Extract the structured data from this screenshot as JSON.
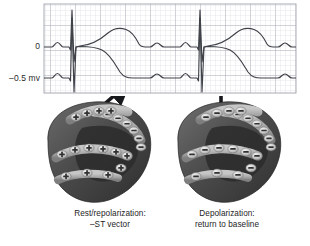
{
  "figure": {
    "kind": "ecg-vector-diagram",
    "background_color": "#ffffff"
  },
  "ecg": {
    "y_axis": {
      "labels": [
        {
          "text": "0",
          "value": 0,
          "unit": "mv"
        },
        {
          "text": "–0.5 mv",
          "value": -0.5,
          "unit": "mv"
        }
      ]
    },
    "grid": {
      "minor_color": "#d8dae0",
      "major_color": "#a9acb5",
      "minor_spacing_px": 5,
      "major_every": 5,
      "left_px": 44,
      "right_px": 296,
      "top_px": 4,
      "bottom_px": 93
    },
    "traces": [
      {
        "name": "upper-trace",
        "description": "normal ECG returning to 0 baseline",
        "baseline_mv": 0,
        "color": "#3f4248"
      },
      {
        "name": "lower-trace",
        "description": "ECG with depressed baseline at -0.5 mv",
        "baseline_mv": -0.5,
        "color": "#3f4248"
      }
    ],
    "beats": [
      {
        "qrs_x_px": 72
      },
      {
        "qrs_x_px": 200
      }
    ]
  },
  "arrows": [
    {
      "name": "st-vector-arrow",
      "direction": "diagonal-up-right",
      "from": "left heart diagram",
      "to": "lower trace baseline",
      "color": "#17181b"
    },
    {
      "name": "baseline-return-arrow",
      "direction": "vertical-up",
      "from": "right heart diagram",
      "to": "upper trace baseline",
      "color": "#17181b"
    }
  ],
  "diagrams": [
    {
      "name": "left-heart",
      "caption_line1": "Rest/repolarization:",
      "caption_line2": "–ST vector",
      "charge_symbols": {
        "outer": "+",
        "inner": "–"
      },
      "charge_counts": {
        "plus": 14,
        "minus": 7
      }
    },
    {
      "name": "right-heart",
      "caption_line1": "Depolarization:",
      "caption_line2": "return to baseline",
      "charge_symbols": {
        "outer": "–",
        "inner": "–"
      },
      "charge_counts": {
        "plus": 0,
        "minus": 21
      }
    }
  ],
  "colors": {
    "myocardium_dark": "#3d3d3d",
    "myocardium_mid": "#595959",
    "band_light": "#b0b0b0",
    "band_edge": "#8c8c8c",
    "charge_disc": "#cfcfcf",
    "charge_glyph": "#303030",
    "trace": "#3f4248",
    "arrow": "#17181b",
    "text": "#1d1d1d"
  }
}
